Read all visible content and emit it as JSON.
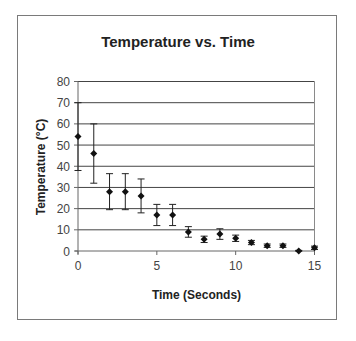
{
  "chart_data": {
    "type": "scatter",
    "title": "Temperature vs. Time",
    "xlabel": "Time (Seconds)",
    "ylabel": "Temperature (°C)",
    "xlim": [
      0,
      15
    ],
    "ylim": [
      0,
      80
    ],
    "xticks": [
      0,
      5,
      10,
      15
    ],
    "yticks": [
      0,
      10,
      20,
      30,
      40,
      50,
      60,
      70,
      80
    ],
    "grid": "horizontal major gridlines",
    "legend": "none",
    "marker": "diamond",
    "error_bars": true,
    "series": [
      {
        "name": "Temperature",
        "x": [
          0,
          1,
          2,
          3,
          4,
          5,
          6,
          7,
          8,
          9,
          10,
          11,
          12,
          13,
          14,
          15
        ],
        "y": [
          54,
          46,
          28,
          28,
          26,
          17,
          17,
          9,
          5.5,
          8,
          6,
          4,
          2.5,
          2.5,
          0,
          1.5
        ],
        "error": [
          16,
          14,
          8.5,
          8.5,
          8,
          5,
          5,
          2.5,
          1.5,
          2.5,
          1.5,
          1,
          0.8,
          0.8,
          0.3,
          0.8
        ]
      }
    ]
  },
  "colors": {
    "marker": "#111111",
    "gridline": "#444444",
    "axis": "#666666",
    "frame": "#7a7a7a",
    "text": "#222222"
  }
}
